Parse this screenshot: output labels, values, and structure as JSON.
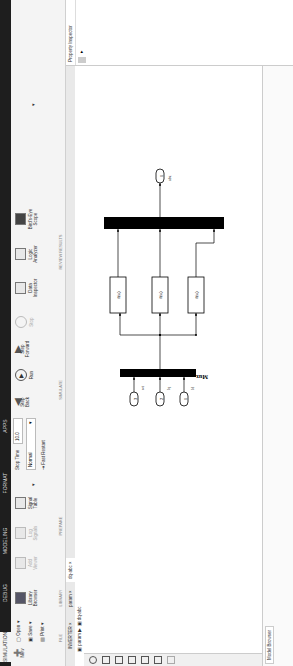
{
  "toolstrip": {
    "tabs": [
      {
        "label": "SIMULATION",
        "active": true
      },
      {
        "label": "DEBUG",
        "active": false
      },
      {
        "label": "MODELING",
        "active": false
      },
      {
        "label": "FORMAT",
        "active": false
      },
      {
        "label": "APPS",
        "active": false
      }
    ],
    "file": {
      "new_label": "New",
      "open_label": "Open",
      "save_label": "Save",
      "print_label": "Print",
      "section": "FILE"
    },
    "library": {
      "library_browser_label": "Library Browser",
      "section": "LIBRARY"
    },
    "prepare": {
      "add_viewer_label": "Add Viewer",
      "log_signals_label": "Log Signals",
      "signal_table_label": "Signal Table",
      "section": "PREPARE"
    },
    "simulate": {
      "stop_time_label": "Stop Time",
      "stop_time_value": "10.0",
      "mode_value": "Normal",
      "fast_restart_label": "Fast Restart",
      "step_back_label": "Step Back",
      "run_label": "Run",
      "step_forward_label": "Step Forward",
      "stop_label": "Stop",
      "section": "SIMULATE"
    },
    "review": {
      "data_inspector_label": "Data Inspector",
      "logic_analyzer_label": "Logic Analyzer",
      "bird_eye_label": "Bird's-Eye Scope",
      "section": "REVIEW RESULTS"
    }
  },
  "doc_tabs": [
    {
      "label": "INVERTER",
      "active": false
    },
    {
      "label": "param",
      "active": false
    },
    {
      "label": "dq-abc",
      "active": true
    }
  ],
  "breadcrumb": {
    "root": "param",
    "separator": "▶",
    "current": "dq-abc"
  },
  "property_inspector": {
    "title": "Property Inspector"
  },
  "model_browser": {
    "label": "Model Browser"
  },
  "diagram": {
    "inports": [
      {
        "num": "1",
        "name": "Id"
      },
      {
        "num": "2",
        "name": "Iq"
      },
      {
        "num": "3",
        "name": "wt"
      }
    ],
    "mux_label": "Mux",
    "fcn_blocks": [
      {
        "label": "f(u)"
      },
      {
        "label": "f(u)"
      },
      {
        "label": "f(u)"
      }
    ],
    "outport": {
      "num": "1",
      "name": "abc"
    }
  }
}
